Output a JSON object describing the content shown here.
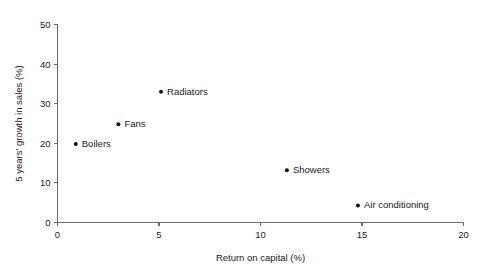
{
  "chart_data": {
    "type": "scatter",
    "title": "",
    "xlabel": "Return on capital (%)",
    "ylabel": "5 years' growth in sales (%)",
    "xlim": [
      0,
      20
    ],
    "ylim": [
      0,
      50
    ],
    "xticks": [
      0,
      5,
      10,
      15,
      20
    ],
    "yticks": [
      0,
      10,
      20,
      30,
      40,
      50
    ],
    "xticklabels": [
      "0",
      "5",
      "10",
      "15",
      "20"
    ],
    "yticklabels": [
      "0",
      "10",
      "20",
      "30",
      "40",
      "50"
    ],
    "grid": false,
    "legend": "none",
    "marker_color": "#111111",
    "axis_color": "#6b6b6b",
    "points": [
      {
        "label": "Boilers",
        "x": 0.9,
        "y": 19.8
      },
      {
        "label": "Fans",
        "x": 3.0,
        "y": 24.8
      },
      {
        "label": "Radiators",
        "x": 5.1,
        "y": 33.0
      },
      {
        "label": "Showers",
        "x": 11.3,
        "y": 13.2
      },
      {
        "label": "Air conditioning",
        "x": 14.8,
        "y": 4.3
      }
    ]
  }
}
